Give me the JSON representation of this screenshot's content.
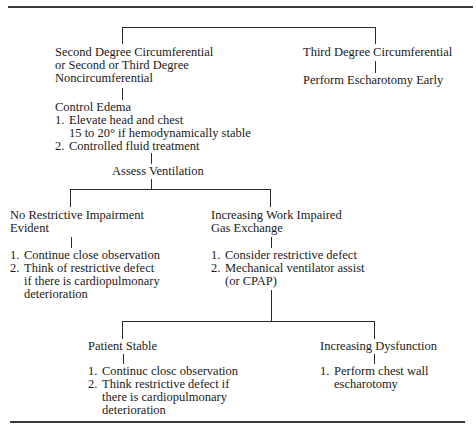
{
  "nodes": {
    "branch_a_title": [
      "Second Degree Circumferential",
      "or Second or Third Degree",
      "Noncircumferential"
    ],
    "branch_b_title": "Third Degree Circumferential",
    "branch_b_action": "Perform Escharotomy Early",
    "control_edema": {
      "title": "Control Edema",
      "items": [
        {
          "num": "1.",
          "lines": [
            "Elevate head and chest",
            "15 to 20° if hemodynamically stable"
          ]
        },
        {
          "num": "2.",
          "lines": [
            "Controlled fluid treatment"
          ]
        }
      ]
    },
    "assess_ventilation": "Assess Ventilation",
    "no_restrictive": {
      "title": [
        "No Restrictive Impairment",
        "Evident"
      ],
      "items": [
        {
          "num": "1.",
          "lines": [
            "Continue close observation"
          ]
        },
        {
          "num": "2.",
          "lines": [
            "Think of restrictive defect",
            "if there is cardiopulmonary",
            "deterioration"
          ]
        }
      ]
    },
    "increasing_work": {
      "title": [
        "Increasing Work Impaired",
        "Gas Exchange"
      ],
      "items": [
        {
          "num": "1.",
          "lines": [
            "Consider restrictive defect"
          ]
        },
        {
          "num": "2.",
          "lines": [
            "Mechanical ventilator assist",
            "(or CPAP)"
          ]
        }
      ]
    },
    "patient_stable": {
      "title": "Patient Stable",
      "items": [
        {
          "num": "1.",
          "lines": [
            "Continuc closc observation"
          ]
        },
        {
          "num": "2.",
          "lines": [
            "Think restrictive defect if",
            "there is cardiopulmonary",
            "deterioration"
          ]
        }
      ]
    },
    "increasing_dysfunction": {
      "title": "Increasing Dysfunction",
      "items": [
        {
          "num": "1.",
          "lines": [
            "Perform chest wall",
            "escharotomy"
          ]
        }
      ]
    }
  }
}
